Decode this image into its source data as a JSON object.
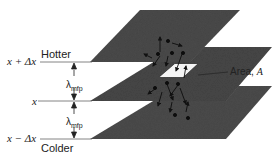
{
  "diagram": {
    "levels": [
      {
        "position_label": "x + Δx",
        "temperature_label": "Hotter"
      },
      {
        "position_label": "x",
        "temperature_label": ""
      },
      {
        "position_label": "x − Δx",
        "temperature_label": "Colder"
      }
    ],
    "spacing_label": "λ",
    "spacing_subscript": "mfp",
    "area_label": "Area, ",
    "area_symbol": "A",
    "colors": {
      "plane": "#4a4a4a",
      "plane_edge": "#2e2e2e",
      "line": "#555555",
      "text": "#222222",
      "background": "#ffffff"
    }
  }
}
